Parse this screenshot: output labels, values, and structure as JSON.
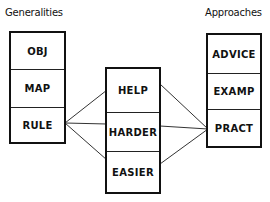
{
  "diagram": {
    "left": {
      "title": "Generalities",
      "items": [
        "OBJ",
        "MAP",
        "RULE"
      ]
    },
    "middle": {
      "items": [
        "HELP",
        "HARDER",
        "EASIER"
      ]
    },
    "right": {
      "title": "Approaches",
      "items": [
        "ADVICE",
        "EXAMP",
        "PRACT"
      ]
    },
    "connections": [
      {
        "from": "RULE",
        "to": "HELP"
      },
      {
        "from": "RULE",
        "to": "HARDER"
      },
      {
        "from": "RULE",
        "to": "EASIER"
      },
      {
        "from": "HELP",
        "to": "PRACT"
      },
      {
        "from": "HARDER",
        "to": "PRACT"
      },
      {
        "from": "EASIER",
        "to": "PRACT"
      }
    ],
    "colors": {
      "ink": "#111111",
      "background": "#ffffff"
    }
  }
}
